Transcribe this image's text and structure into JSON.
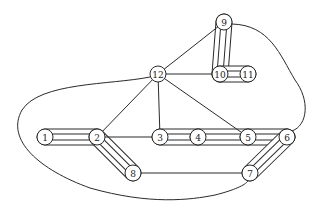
{
  "diagram": {
    "type": "graph",
    "nodes": [
      {
        "id": "1",
        "label": "1",
        "x": 45,
        "y": 137
      },
      {
        "id": "2",
        "label": "2",
        "x": 97,
        "y": 137
      },
      {
        "id": "3",
        "label": "3",
        "x": 160,
        "y": 137
      },
      {
        "id": "4",
        "label": "4",
        "x": 198,
        "y": 137
      },
      {
        "id": "5",
        "label": "5",
        "x": 248,
        "y": 137
      },
      {
        "id": "6",
        "label": "6",
        "x": 287,
        "y": 137
      },
      {
        "id": "7",
        "label": "7",
        "x": 250,
        "y": 173
      },
      {
        "id": "8",
        "label": "8",
        "x": 133,
        "y": 173
      },
      {
        "id": "9",
        "label": "9",
        "x": 224,
        "y": 22
      },
      {
        "id": "10",
        "label": "10",
        "x": 220,
        "y": 74
      },
      {
        "id": "11",
        "label": "11",
        "x": 248,
        "y": 74
      },
      {
        "id": "12",
        "label": "12",
        "x": 158,
        "y": 74
      }
    ],
    "band_edges": [
      {
        "from": "1",
        "to": "2"
      },
      {
        "from": "2",
        "to": "8"
      },
      {
        "from": "3",
        "to": "4"
      },
      {
        "from": "4",
        "to": "5"
      },
      {
        "from": "5",
        "to": "6"
      },
      {
        "from": "6",
        "to": "7"
      },
      {
        "from": "9",
        "to": "10"
      },
      {
        "from": "10",
        "to": "11"
      }
    ],
    "single_edges": [
      {
        "from": "12",
        "to": "9"
      },
      {
        "from": "12",
        "to": "10"
      },
      {
        "from": "12",
        "to": "2"
      },
      {
        "from": "12",
        "to": "3"
      },
      {
        "from": "12",
        "to": "5"
      },
      {
        "from": "2",
        "to": "3"
      },
      {
        "from": "8",
        "to": "7"
      }
    ],
    "curved_edges": [
      {
        "from": "12",
        "to": "7",
        "route": "around-left-bottom"
      },
      {
        "from": "9",
        "to": "6",
        "route": "around-right"
      }
    ]
  }
}
